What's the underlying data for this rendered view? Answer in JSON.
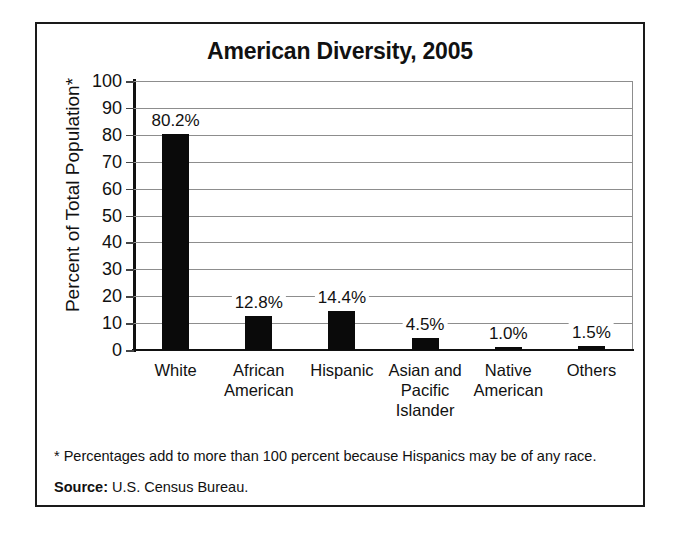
{
  "chart_data": {
    "type": "bar",
    "title": "American Diversity, 2005",
    "xlabel": "",
    "ylabel": "Percent of Total Population*",
    "ylim": [
      0,
      100
    ],
    "ytick_step": 10,
    "yticks": [
      100,
      90,
      80,
      70,
      60,
      50,
      40,
      30,
      20,
      10,
      0
    ],
    "grid": true,
    "legend": "none",
    "categories": [
      "White",
      "African American",
      "Hispanic",
      "Asian and Pacific Islander",
      "Native American",
      "Others"
    ],
    "category_lines": [
      [
        "White"
      ],
      [
        "African",
        "American"
      ],
      [
        "Hispanic"
      ],
      [
        "Asian and",
        "Pacific",
        "Islander"
      ],
      [
        "Native",
        "American"
      ],
      [
        "Others"
      ]
    ],
    "values": [
      80.2,
      12.8,
      14.4,
      4.5,
      1.0,
      1.5
    ],
    "data_labels": [
      "80.2%",
      "12.8%",
      "14.4%",
      "4.5%",
      "1.0%",
      "1.5%"
    ],
    "bar_color": "#0a0a0a",
    "grid_color": "#8d8d8d",
    "axis_color": "#111111"
  },
  "footnote": {
    "text": "* Percentages add to more than 100 percent because Hispanics may be of any race."
  },
  "source": {
    "label": "Source:",
    "value": "U.S. Census Bureau."
  }
}
